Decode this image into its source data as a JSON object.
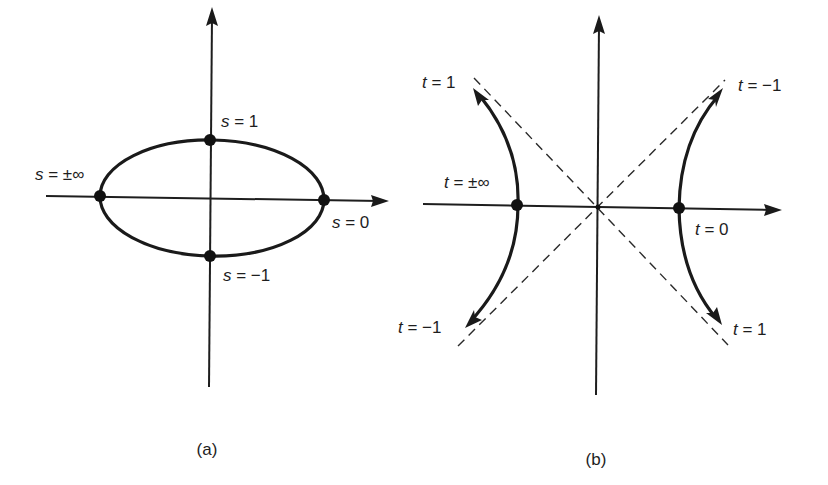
{
  "figure": {
    "panels": [
      {
        "id": "a",
        "caption": "(a)",
        "curve_type": "ellipse",
        "points": [
          {
            "name": "top",
            "var": "s",
            "eq": " = 1"
          },
          {
            "name": "bottom",
            "var": "s",
            "eq": " = −1"
          },
          {
            "name": "left",
            "var": "s",
            "eq": " = ±∞"
          },
          {
            "name": "right",
            "var": "s",
            "eq": " = 0"
          }
        ]
      },
      {
        "id": "b",
        "caption": "(b)",
        "curve_type": "hyperbola",
        "asymptotes": "dashed",
        "points": [
          {
            "name": "upper-left-arrow",
            "var": "t",
            "eq": " = 1"
          },
          {
            "name": "upper-right-arrow",
            "var": "t",
            "eq": " = −1"
          },
          {
            "name": "left-vertex",
            "var": "t",
            "eq": " = ±∞"
          },
          {
            "name": "right-vertex",
            "var": "t",
            "eq": " = 0"
          },
          {
            "name": "lower-left-arrow",
            "var": "t",
            "eq": " = −1"
          },
          {
            "name": "lower-right-arrow",
            "var": "t",
            "eq": " = 1"
          }
        ]
      }
    ]
  },
  "colors": {
    "ink": "#1a1a1a",
    "background": "#ffffff"
  }
}
